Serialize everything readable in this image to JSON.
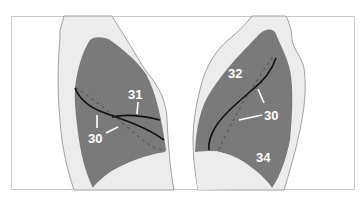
{
  "figure": {
    "colors": {
      "background": "#ffffff",
      "frame": "#c8c8c8",
      "body_outline_fill": "#ececec",
      "body_outline_stroke": "#8a8a8a",
      "lung_fill": "#7a7a7a",
      "fissure_line": "#111111",
      "dotted_line": "#5e5e5e",
      "label_color": "#ffffff"
    }
  },
  "left_panel": {
    "labels": [
      {
        "id": "label-31",
        "text": "31"
      },
      {
        "id": "label-30",
        "text": "30"
      }
    ]
  },
  "right_panel": {
    "labels": [
      {
        "id": "label-32",
        "text": "32"
      },
      {
        "id": "label-30",
        "text": "30"
      },
      {
        "id": "label-34",
        "text": "34"
      }
    ]
  }
}
